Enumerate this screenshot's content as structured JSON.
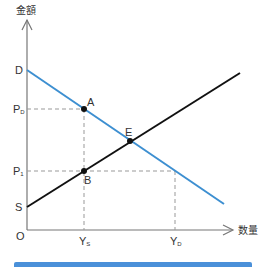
{
  "diagram": {
    "axes": {
      "y_label": "金額",
      "x_label": "数量",
      "origin": "O"
    },
    "y_ticks": [
      {
        "label": "D",
        "y": 70
      },
      {
        "label": "P",
        "sub": "D",
        "y": 109
      },
      {
        "label": "P",
        "sub": "1",
        "y": 171
      },
      {
        "label": "S",
        "y": 207
      }
    ],
    "x_ticks": [
      {
        "label": "Y",
        "sub": "S",
        "x": 84
      },
      {
        "label": "Y",
        "sub": "D",
        "x": 175
      }
    ],
    "points": [
      {
        "label": "A",
        "x": 84,
        "y": 109
      },
      {
        "label": "E",
        "x": 130,
        "y": 141
      },
      {
        "label": "B",
        "x": 84,
        "y": 171
      }
    ],
    "lines": {
      "demand": {
        "name": "Demand (D)",
        "color": "#3d8fd1",
        "from": [
          27,
          70
        ],
        "to": [
          224,
          204
        ]
      },
      "supply": {
        "name": "Supply (S)",
        "color": "#111111",
        "from": [
          27,
          207
        ],
        "to": [
          240,
          73
        ]
      }
    },
    "colors": {
      "accent_bar": "#4a90d9",
      "axis": "#777777",
      "guide": "#999999"
    }
  }
}
